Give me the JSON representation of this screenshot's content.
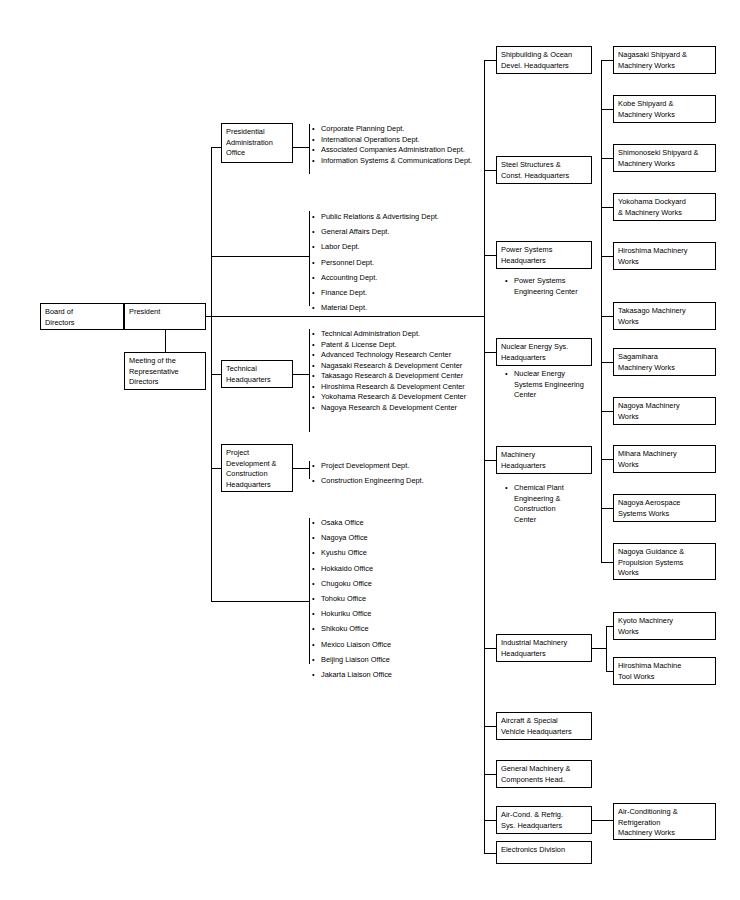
{
  "chart": {
    "root": {
      "label": "Board of\nDirectors"
    },
    "president": {
      "label": "President"
    },
    "meeting": {
      "label": "Meeting of the\nRepresentative\nDirectors"
    },
    "staff_units": [
      {
        "label": "Presidential\nAdministration\nOffice"
      },
      {
        "label": "Technical\nHeadquarters"
      },
      {
        "label": "Project\nDevelopment &\nConstruction\nHeadquarters"
      }
    ],
    "presidential_depts": [
      "Corporate Planning Dept.",
      "International Operations Dept.",
      "Associated Companies Administration Dept.",
      "Information Systems & Communications Dept."
    ],
    "corporate_depts": [
      "Public Relations & Advertising Dept.",
      "General Affairs Dept.",
      "Labor Dept.",
      "Personnel Dept.",
      "Accounting Dept.",
      "Finance Dept.",
      "Material Dept."
    ],
    "technical_depts": [
      "Technical Administration Dept.",
      "Patent & License Dept.",
      "Advanced Technology Research Center",
      "Nagasaki Research & Development Center",
      "Takasago Research & Development Center",
      "Hiroshima Research & Development Center",
      "Yokohama Research & Development Center",
      "Nagoya Research & Development Center"
    ],
    "project_depts": [
      "Project Development Dept.",
      "Construction Engineering Dept."
    ],
    "offices": [
      "Osaka Office",
      "Nagoya Office",
      "Kyushu Office",
      "Hokkaido Office",
      "Chugoku Office",
      "Tohoku Office",
      "Hokuriku Office",
      "Shikoku Office",
      "Mexico Liaison Office",
      "Beijing Liaison Office",
      "Jakarta Liaison Office"
    ],
    "headquarters": [
      {
        "label": "Shipbuilding & Ocean\nDevel. Headquarters"
      },
      {
        "label": "Steel Structures &\nConst. Headquarters"
      },
      {
        "label": "Power Systems\nHeadquarters"
      },
      {
        "label": "Nuclear Energy Sys.\nHeadquarters"
      },
      {
        "label": "Machinery\nHeadquarters"
      },
      {
        "label": "Industrial Machinery\nHeadquarters"
      },
      {
        "label": "Aircraft & Special\nVehicle Headquarters"
      },
      {
        "label": "General Machinery &\nComponents Head."
      },
      {
        "label": "Air-Cond. & Refrig.\nSys. Headquarters"
      },
      {
        "label": "Electronics Division"
      }
    ],
    "hq_centers": {
      "power": "Power Systems\nEngineering Center",
      "nuclear": "Nuclear Energy\nSystems Engineering\nCenter",
      "machinery": "Chemical Plant\nEngineering &\nConstruction\nCenter"
    },
    "works": [
      {
        "label": "Nagasaki Shipyard &\nMachinery Works"
      },
      {
        "label": "Kobe Shipyard &\nMachinery Works"
      },
      {
        "label": "Shimonoseki  Shipyard &\nMachinery Works"
      },
      {
        "label": "Yokohama Dockyard\n& Machinery Works"
      },
      {
        "label": "Hiroshima Machinery\nWorks"
      },
      {
        "label": "Takasago Machinery\nWorks"
      },
      {
        "label": "Sagamihara\nMachinery Works"
      },
      {
        "label": "Nagoya Machinery\nWorks"
      },
      {
        "label": "Mihara Machinery\nWorks"
      },
      {
        "label": "Nagoya Aerospace\nSystems Works"
      },
      {
        "label": "Nagoya Guidance &\nPropulsion Systems\nWorks"
      }
    ],
    "industrial_works": [
      {
        "label": "Kyoto  Machinery\nWorks"
      },
      {
        "label": "Hiroshima Machine\nTool Works"
      }
    ],
    "aircond_works": [
      {
        "label": "Air-Conditioning  &\nRefrigeration\nMachinery Works"
      }
    ],
    "colors": {
      "line": "#000000",
      "box_border": "#000000",
      "text": "#000000",
      "background": "#ffffff"
    }
  }
}
